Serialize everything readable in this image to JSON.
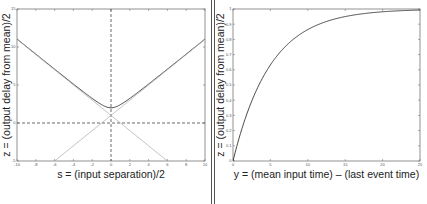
{
  "chart_data": [
    {
      "type": "line",
      "xlabel": "s = (input separation)/2",
      "ylabel": "z = (output delay from mean)/2",
      "xlim": [
        -10,
        10
      ],
      "ylim": [
        -5,
        15
      ],
      "xticks": [
        -10,
        -8,
        -6,
        -4,
        -2,
        0,
        2,
        4,
        6,
        8,
        10
      ],
      "xtick_labels": [
        "-10",
        "-8",
        "-6",
        "-4",
        "-2",
        "0",
        "2",
        "4",
        "6",
        "8",
        "10"
      ],
      "yticks": [
        -5,
        0,
        5,
        10,
        15
      ],
      "ytick_labels": [
        "-5",
        "0",
        "5",
        "10",
        "15"
      ],
      "grid": false,
      "reference_lines": [
        {
          "orientation": "vertical",
          "value": 0,
          "style": "dashed"
        },
        {
          "orientation": "horizontal",
          "value": 0,
          "style": "dashed"
        }
      ],
      "series": [
        {
          "name": "z = 1 + sqrt(s^2 + 1)",
          "style": "solid-dark",
          "x": [
            -10,
            -8,
            -6,
            -4,
            -2,
            -1,
            0,
            1,
            2,
            4,
            6,
            8,
            10
          ],
          "y": [
            11.05,
            9.06,
            7.08,
            5.12,
            3.24,
            2.41,
            2.0,
            2.41,
            3.24,
            5.12,
            7.08,
            9.06,
            11.05
          ]
        },
        {
          "name": "asymptote z = 1 - s",
          "style": "solid-light",
          "x": [
            -10,
            6
          ],
          "y": [
            11,
            -5
          ]
        },
        {
          "name": "asymptote z = 1 + s",
          "style": "solid-light",
          "x": [
            -6,
            10
          ],
          "y": [
            -5,
            11
          ]
        }
      ]
    },
    {
      "type": "line",
      "xlabel": "y = (mean input time) – (last event time)",
      "ylabel": "z = (output delay from mean)/2",
      "xlim": [
        0,
        25
      ],
      "ylim": [
        0,
        1
      ],
      "xticks": [
        0,
        5,
        10,
        15,
        20,
        25
      ],
      "xtick_labels": [
        "0",
        "5",
        "10",
        "15",
        "20",
        "25"
      ],
      "yticks": [
        0,
        0.1,
        0.2,
        0.3,
        0.4,
        0.5,
        0.6,
        0.7,
        0.8,
        0.9,
        1
      ],
      "ytick_labels": [
        "0",
        "0.1",
        "0.2",
        "0.3",
        "0.4",
        "0.5",
        "0.6",
        "0.7",
        "0.8",
        "0.9",
        "1"
      ],
      "grid": false,
      "series": [
        {
          "name": "z = 1 - exp(-y/5)",
          "style": "solid-dark",
          "x": [
            0,
            1,
            2,
            3,
            4,
            5,
            6,
            8,
            10,
            12,
            15,
            20,
            25
          ],
          "y": [
            0,
            0.18,
            0.33,
            0.45,
            0.55,
            0.63,
            0.7,
            0.8,
            0.86,
            0.91,
            0.95,
            0.98,
            0.99
          ]
        }
      ]
    }
  ]
}
